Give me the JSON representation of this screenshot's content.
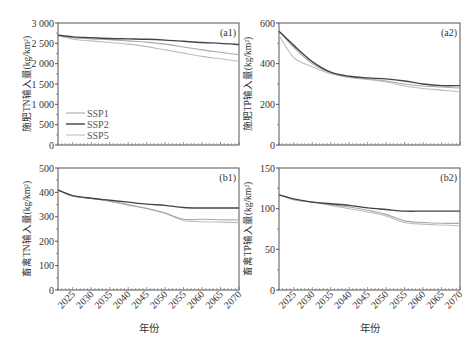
{
  "figure": {
    "xlabel": "年份",
    "legend": [
      {
        "name": "SSP1",
        "color": "#a8a8a8"
      },
      {
        "name": "SSP2",
        "color": "#444444"
      },
      {
        "name": "SSP5",
        "color": "#bdbdbd"
      }
    ]
  },
  "chart_data": [
    {
      "id": "a1",
      "type": "line",
      "tag": "(a1)",
      "ylabel": "施肥TN输入量(kg/km²)",
      "xlabel": "",
      "ylim": [
        0,
        3000
      ],
      "yticks": [
        0,
        500,
        1000,
        1500,
        2000,
        2500,
        3000
      ],
      "ytick_labels": [
        "0",
        "500",
        "1 000",
        "1 500",
        "2 000",
        "2 500",
        "3 000"
      ],
      "xlim": [
        2021,
        2070
      ],
      "x": [
        2021,
        2025,
        2030,
        2035,
        2040,
        2045,
        2050,
        2055,
        2060,
        2065,
        2070
      ],
      "series": [
        {
          "name": "SSP1",
          "values": [
            2700,
            2640,
            2610,
            2590,
            2560,
            2530,
            2480,
            2410,
            2340,
            2280,
            2220
          ]
        },
        {
          "name": "SSP2",
          "values": [
            2700,
            2660,
            2640,
            2620,
            2610,
            2600,
            2580,
            2550,
            2520,
            2500,
            2470
          ]
        },
        {
          "name": "SSP5",
          "values": [
            2700,
            2600,
            2560,
            2520,
            2480,
            2420,
            2340,
            2260,
            2180,
            2120,
            2060
          ]
        }
      ],
      "legend_position": "lower-left"
    },
    {
      "id": "a2",
      "type": "line",
      "tag": "(a2)",
      "ylabel": "施肥TP输入量(kg/km²)",
      "xlabel": "",
      "ylim": [
        0,
        600
      ],
      "yticks": [
        0,
        200,
        400,
        600
      ],
      "ytick_labels": [
        "0",
        "200",
        "400",
        "600"
      ],
      "xlim": [
        2021,
        2070
      ],
      "x": [
        2021,
        2025,
        2030,
        2035,
        2040,
        2045,
        2050,
        2055,
        2060,
        2065,
        2070
      ],
      "series": [
        {
          "name": "SSP1",
          "values": [
            560,
            480,
            400,
            355,
            335,
            325,
            315,
            300,
            290,
            285,
            280
          ]
        },
        {
          "name": "SSP2",
          "values": [
            560,
            490,
            410,
            358,
            338,
            330,
            325,
            315,
            300,
            292,
            292
          ]
        },
        {
          "name": "SSP5",
          "values": [
            540,
            430,
            385,
            350,
            332,
            322,
            310,
            290,
            278,
            270,
            262
          ]
        }
      ]
    },
    {
      "id": "b1",
      "type": "line",
      "tag": "(b1)",
      "ylabel": "畜禽TN输入量(kg/km²)",
      "xlabel": "年份",
      "ylim": [
        0,
        500
      ],
      "yticks": [
        0,
        100,
        200,
        300,
        400,
        500
      ],
      "ytick_labels": [
        "0",
        "100",
        "200",
        "300",
        "400",
        "500"
      ],
      "xlim": [
        2021,
        2070
      ],
      "x": [
        2021,
        2025,
        2030,
        2035,
        2040,
        2045,
        2050,
        2055,
        2060,
        2065,
        2070
      ],
      "xtick_labels": [
        "2025",
        "2030",
        "2035",
        "2040",
        "2045",
        "2050",
        "2055",
        "2060",
        "2065",
        "2070"
      ],
      "series": [
        {
          "name": "SSP1",
          "values": [
            410,
            385,
            375,
            365,
            350,
            335,
            315,
            290,
            290,
            288,
            287
          ]
        },
        {
          "name": "SSP2",
          "values": [
            410,
            387,
            376,
            368,
            360,
            352,
            347,
            338,
            336,
            336,
            336
          ]
        },
        {
          "name": "SSP5",
          "values": [
            410,
            385,
            375,
            363,
            347,
            333,
            315,
            285,
            280,
            278,
            276
          ]
        }
      ]
    },
    {
      "id": "b2",
      "type": "line",
      "tag": "(b2)",
      "ylabel": "畜禽TP输入量(kg/km²)",
      "xlabel": "年份",
      "ylim": [
        0,
        150
      ],
      "yticks": [
        0,
        50,
        100,
        150
      ],
      "ytick_labels": [
        "0",
        "50",
        "100",
        "150"
      ],
      "xlim": [
        2021,
        2070
      ],
      "x": [
        2021,
        2025,
        2030,
        2035,
        2040,
        2045,
        2050,
        2055,
        2060,
        2065,
        2070
      ],
      "xtick_labels": [
        "2025",
        "2030",
        "2035",
        "2040",
        "2045",
        "2050",
        "2055",
        "2060",
        "2065",
        "2070"
      ],
      "series": [
        {
          "name": "SSP1",
          "values": [
            117,
            111,
            108,
            105,
            102,
            98,
            93,
            85,
            83,
            82,
            82
          ]
        },
        {
          "name": "SSP2",
          "values": [
            117,
            112,
            108,
            106,
            104,
            101,
            99,
            97,
            97,
            97,
            97
          ]
        },
        {
          "name": "SSP5",
          "values": [
            117,
            111,
            108,
            104,
            100,
            96,
            91,
            83,
            81,
            80,
            79
          ]
        }
      ]
    }
  ]
}
